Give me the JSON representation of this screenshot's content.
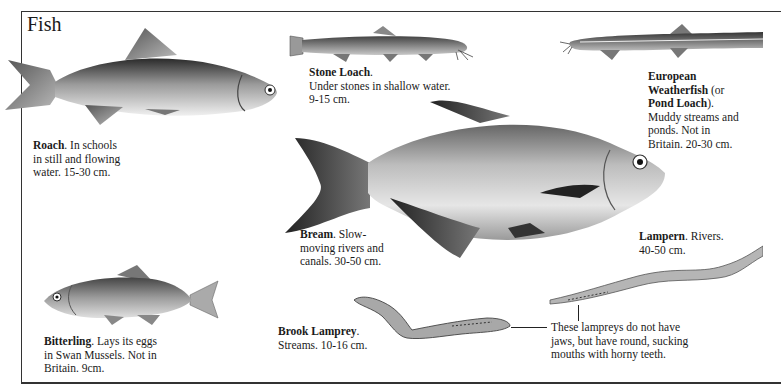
{
  "page": {
    "title": "Fish"
  },
  "species": [
    {
      "id": "roach",
      "name": "Roach",
      "suffix": ". In schools",
      "lines": [
        "in still and flowing",
        "water. 15-30 cm."
      ]
    },
    {
      "id": "stone-loach",
      "name": "Stone Loach",
      "suffix": ".",
      "lines": [
        "Under stones in shallow water.",
        "9-15 cm."
      ]
    },
    {
      "id": "weatherfish",
      "name_line1": "European",
      "name_line2": "Weatherfish",
      "paren_open": " (or",
      "alt_name": "Pond Loach",
      "alt_suffix": ").",
      "lines": [
        "Muddy streams and",
        "ponds. Not in",
        "Britain. 20-30 cm."
      ]
    },
    {
      "id": "bream",
      "name": "Bream",
      "suffix": ". Slow-",
      "lines": [
        "moving rivers and",
        "canals. 30-50 cm."
      ]
    },
    {
      "id": "lampern",
      "name": "Lampern",
      "suffix": ". Rivers.",
      "lines": [
        "40-50 cm."
      ]
    },
    {
      "id": "bitterling",
      "name": "Bitterling",
      "suffix": ". Lays its eggs",
      "lines": [
        "in Swan Mussels. Not in",
        "Britain. 9cm."
      ]
    },
    {
      "id": "brook-lamprey",
      "name": "Brook Lamprey",
      "suffix": ".",
      "lines": [
        "Streams. 10-16 cm."
      ]
    }
  ],
  "note": {
    "lines": [
      "These lampreys do not have",
      "jaws, but have round, sucking",
      "mouths with horny teeth."
    ]
  },
  "illustrations": [
    "roach-illustration",
    "stone-loach-illustration",
    "weatherfish-illustration",
    "bream-illustration",
    "lampern-illustration",
    "bitterling-illustration",
    "brook-lamprey-illustration"
  ]
}
